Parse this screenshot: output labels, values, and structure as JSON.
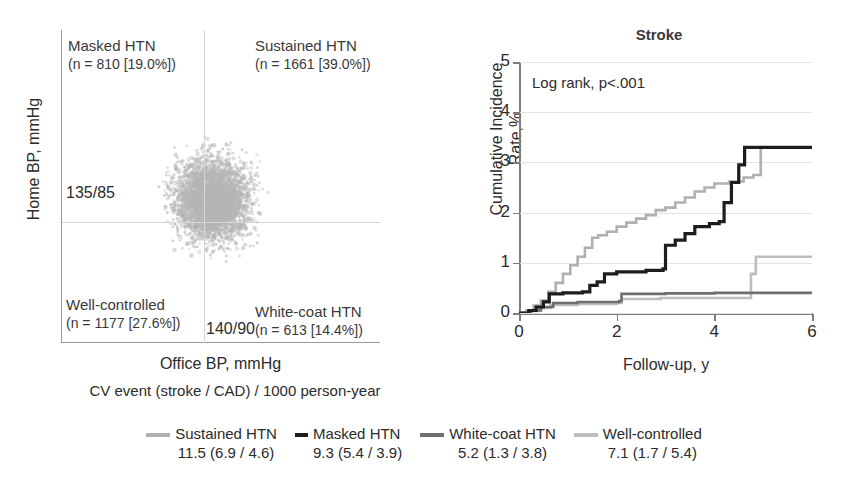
{
  "figure": {
    "scatter": {
      "ylabel": "Home BP, mmHg",
      "xlabel": "Office BP, mmHg",
      "home_threshold": "135/85",
      "office_threshold": "140/90",
      "caption": "CV event (stroke / CAD) / 1000 person-year",
      "quadrants": [
        {
          "key": "masked",
          "name": "Masked HTN",
          "detail": "(n = 810 [19.0%])"
        },
        {
          "key": "sustained",
          "name": "Sustained HTN",
          "detail": "(n = 1661 [39.0%])"
        },
        {
          "key": "wellcontrolled",
          "name": "Well-controlled",
          "detail": "(n = 1177 [27.6%])"
        },
        {
          "key": "whitecoat",
          "name": "White-coat HTN",
          "detail": "(n = 613 [14.4%])"
        }
      ],
      "point_color": "#b9b9b9"
    },
    "km": {
      "title": "Stroke",
      "annotation": "Log rank, p<.001",
      "ylabel_line1": "Cumulative Incidence",
      "ylabel_line2": "Rate,%",
      "xlabel": "Follow-up, y"
    },
    "legend": {
      "items": [
        {
          "label": "Sustained HTN",
          "rate": "11.5 (6.9 / 4.6)",
          "color": "#b0b0b0",
          "swatch": "long"
        },
        {
          "label": "Masked HTN",
          "rate": "9.3 (5.4 / 3.9)",
          "color": "#1d1d1d",
          "swatch": "short"
        },
        {
          "label": "White-coat HTN",
          "rate": "5.2 (1.3 / 3.8)",
          "color": "#6e6e6e",
          "swatch": "long"
        },
        {
          "label": "Well-controlled",
          "rate": "7.1 (1.7 / 5.4)",
          "color": "#bdbdbd",
          "swatch": "long"
        }
      ]
    }
  },
  "chart_data": {
    "type": "line",
    "title": "Stroke",
    "subtitle": "Log rank, p<.001",
    "xlabel": "Follow-up, y",
    "ylabel": "Cumulative Incidence Rate,%",
    "xlim": [
      0,
      6
    ],
    "ylim": [
      0,
      5
    ],
    "xticks": [
      0,
      2,
      4,
      6
    ],
    "yticks": [
      0,
      1,
      2,
      3,
      4,
      5
    ],
    "grid": "horizontal",
    "legend_position": "below-figure",
    "step": true,
    "series": [
      {
        "name": "Sustained HTN",
        "color": "#b0b0b0",
        "event_rate_per_1000py": 11.5,
        "stroke_rate": 6.9,
        "cad_rate": 4.6,
        "points": [
          [
            0,
            0
          ],
          [
            0.15,
            0.05
          ],
          [
            0.3,
            0.15
          ],
          [
            0.45,
            0.25
          ],
          [
            0.6,
            0.42
          ],
          [
            0.75,
            0.6
          ],
          [
            0.9,
            0.78
          ],
          [
            1.05,
            0.95
          ],
          [
            1.2,
            1.12
          ],
          [
            1.35,
            1.3
          ],
          [
            1.5,
            1.5
          ],
          [
            1.62,
            1.55
          ],
          [
            1.8,
            1.62
          ],
          [
            2.0,
            1.72
          ],
          [
            2.2,
            1.8
          ],
          [
            2.4,
            1.88
          ],
          [
            2.6,
            1.95
          ],
          [
            2.8,
            2.05
          ],
          [
            3.0,
            2.1
          ],
          [
            3.2,
            2.2
          ],
          [
            3.4,
            2.3
          ],
          [
            3.6,
            2.42
          ],
          [
            3.8,
            2.5
          ],
          [
            4.0,
            2.58
          ],
          [
            4.3,
            2.62
          ],
          [
            4.6,
            2.7
          ],
          [
            4.8,
            2.75
          ],
          [
            4.95,
            3.3
          ],
          [
            6.0,
            3.3
          ]
        ]
      },
      {
        "name": "Masked HTN",
        "color": "#1d1d1d",
        "event_rate_per_1000py": 9.3,
        "stroke_rate": 5.4,
        "cad_rate": 3.9,
        "points": [
          [
            0,
            0
          ],
          [
            0.2,
            0.05
          ],
          [
            0.35,
            0.12
          ],
          [
            0.5,
            0.22
          ],
          [
            0.62,
            0.38
          ],
          [
            0.9,
            0.4
          ],
          [
            1.3,
            0.42
          ],
          [
            1.45,
            0.55
          ],
          [
            1.6,
            0.62
          ],
          [
            1.75,
            0.78
          ],
          [
            2.0,
            0.82
          ],
          [
            2.6,
            0.85
          ],
          [
            2.95,
            0.88
          ],
          [
            3.0,
            1.35
          ],
          [
            3.2,
            1.45
          ],
          [
            3.4,
            1.58
          ],
          [
            3.6,
            1.72
          ],
          [
            3.9,
            1.78
          ],
          [
            4.1,
            1.82
          ],
          [
            4.2,
            2.2
          ],
          [
            4.35,
            2.6
          ],
          [
            4.5,
            2.95
          ],
          [
            4.62,
            3.3
          ],
          [
            6.0,
            3.3
          ]
        ]
      },
      {
        "name": "White-coat HTN",
        "color": "#6e6e6e",
        "event_rate_per_1000py": 5.2,
        "stroke_rate": 1.3,
        "cad_rate": 3.8,
        "points": [
          [
            0,
            0
          ],
          [
            0.25,
            0.05
          ],
          [
            0.45,
            0.12
          ],
          [
            0.7,
            0.2
          ],
          [
            1.2,
            0.22
          ],
          [
            2.05,
            0.24
          ],
          [
            2.1,
            0.38
          ],
          [
            3.0,
            0.39
          ],
          [
            4.0,
            0.4
          ],
          [
            5.0,
            0.4
          ],
          [
            6.0,
            0.4
          ]
        ]
      },
      {
        "name": "Well-controlled",
        "color": "#bdbdbd",
        "event_rate_per_1000py": 7.1,
        "stroke_rate": 1.7,
        "cad_rate": 5.4,
        "points": [
          [
            0,
            0
          ],
          [
            0.2,
            0.04
          ],
          [
            0.4,
            0.1
          ],
          [
            0.65,
            0.16
          ],
          [
            1.2,
            0.18
          ],
          [
            2.0,
            0.2
          ],
          [
            2.1,
            0.28
          ],
          [
            2.9,
            0.3
          ],
          [
            4.7,
            0.3
          ],
          [
            4.75,
            0.78
          ],
          [
            4.85,
            1.12
          ],
          [
            6.0,
            1.12
          ]
        ]
      }
    ]
  }
}
